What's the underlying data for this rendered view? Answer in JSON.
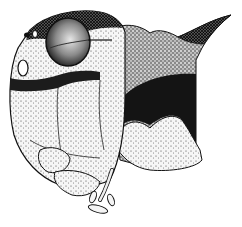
{
  "figure": {
    "alt": "Lateral view of an orthopteran insect head with compound eye, pronotal horn, dark band and mouthparts",
    "colors": {
      "background": "#ffffff",
      "ink": "#111111",
      "light_stipple": "#f2f2f2",
      "mid_stipple": "#bdbdbd",
      "dark_band": "#141414"
    },
    "parts": {
      "eye": "compound-eye",
      "horn": "pronotal-horn",
      "band": "dark-lateral-band",
      "lobe": "pale-pronotal-lobe",
      "face": "frons",
      "mouthparts": "mandibles-and-palps"
    }
  }
}
